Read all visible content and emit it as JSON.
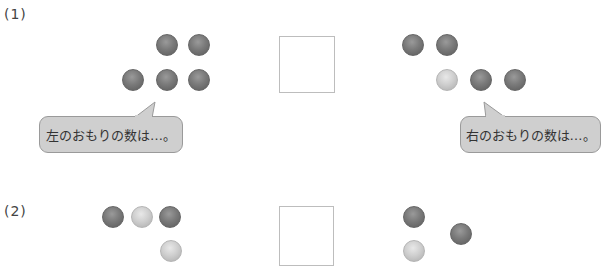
{
  "problems": [
    {
      "label": "(1)",
      "left_weights": [
        {
          "shade": "dark",
          "x": 156,
          "y": 34
        },
        {
          "shade": "dark",
          "x": 188,
          "y": 34
        },
        {
          "shade": "dark",
          "x": 122,
          "y": 69
        },
        {
          "shade": "dark",
          "x": 156,
          "y": 69
        },
        {
          "shade": "dark",
          "x": 188,
          "y": 69
        }
      ],
      "right_weights": [
        {
          "shade": "dark",
          "x": 402,
          "y": 34
        },
        {
          "shade": "dark",
          "x": 436,
          "y": 34
        },
        {
          "shade": "light",
          "x": 436,
          "y": 69
        },
        {
          "shade": "dark",
          "x": 470,
          "y": 69
        },
        {
          "shade": "dark",
          "x": 504,
          "y": 69
        }
      ],
      "left_bubble": "左のおもりの数は…。",
      "right_bubble": "右のおもりの数は…。"
    },
    {
      "label": "(2)",
      "left_weights": [
        {
          "shade": "dark",
          "x": 102,
          "y": 206
        },
        {
          "shade": "light",
          "x": 131,
          "y": 206
        },
        {
          "shade": "dark",
          "x": 159,
          "y": 206
        },
        {
          "shade": "light",
          "x": 160,
          "y": 240
        }
      ],
      "right_weights": [
        {
          "shade": "dark",
          "x": 403,
          "y": 206
        },
        {
          "shade": "dark",
          "x": 450,
          "y": 223
        },
        {
          "shade": "light",
          "x": 403,
          "y": 240
        }
      ]
    }
  ]
}
